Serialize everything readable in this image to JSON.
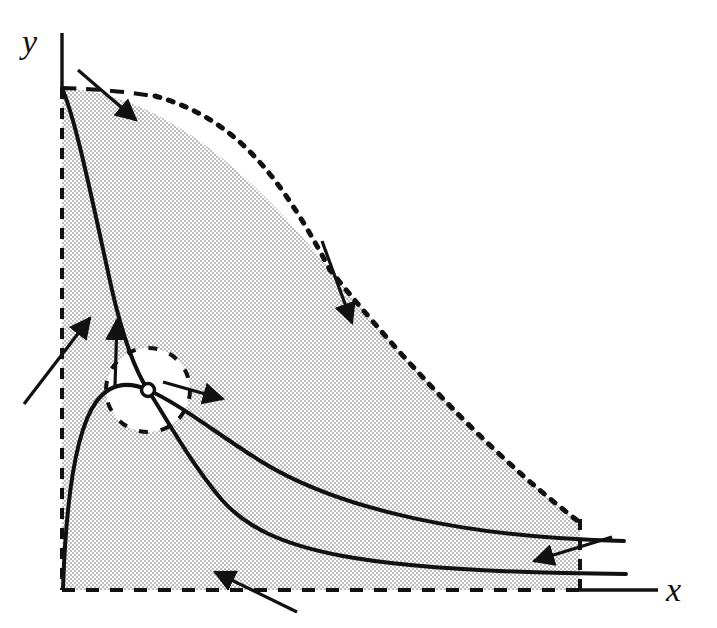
{
  "figure": {
    "kind": "phase-plane-diagram",
    "title": "",
    "background_color": "#ffffff",
    "ink_color": "#111111",
    "shade_fill_color": "#d9d9d9",
    "shade_pattern": "halftone-checker-dots",
    "axes": {
      "y_label": "y",
      "x_label": "x",
      "y_axis_line": {
        "x": 62,
        "y_top": 33,
        "y_bottom": 90
      },
      "x_axis_line": {
        "y": 590,
        "x_left": 578,
        "x_right": 658
      },
      "y_label_pos": {
        "x": 22,
        "y": 52
      },
      "x_label_pos": {
        "x": 666,
        "y": 600
      }
    },
    "region": {
      "name": "shaded-trapping-region",
      "left_boundary_style": "dashed",
      "bottom_boundary_style": "dashed",
      "right_boundary_style": "dashed",
      "diagonal_boundary_style": "dotted",
      "left_x": 62,
      "bottom_y": 590,
      "right_x": 580,
      "top_y": 88
    },
    "curves": [
      {
        "name": "steep-descending-nullcline",
        "style": "solid",
        "description": "steep curve from top-left corner descending through equilibrium to lower right"
      },
      {
        "name": "humped-nullcline",
        "style": "solid",
        "description": "curve rising from origin to a hump then decaying toward the right"
      }
    ],
    "equilibrium_marker": {
      "name": "equilibrium-point",
      "style": "open-circle",
      "cx": 148,
      "cy": 390,
      "r": 6
    },
    "highlight_circle": {
      "name": "equilibrium-neighborhood",
      "style": "dashed",
      "cx": 148,
      "cy": 390,
      "r": 42,
      "fill": "#ffffff"
    },
    "arrows": [
      {
        "name": "flow-arrow-top",
        "x1": 78,
        "y1": 70,
        "x2": 136,
        "y2": 120,
        "direction": "down-right"
      },
      {
        "name": "flow-arrow-diagonal",
        "x1": 322,
        "y1": 241,
        "x2": 352,
        "y2": 323,
        "direction": "down-right"
      },
      {
        "name": "flow-arrow-left-lower",
        "x1": 24,
        "y1": 404,
        "x2": 90,
        "y2": 318,
        "direction": "up-right"
      },
      {
        "name": "flow-arrow-vertical",
        "x1": 115,
        "y1": 386,
        "x2": 117,
        "y2": 318,
        "direction": "up"
      },
      {
        "name": "flow-arrow-equilibrium",
        "x1": 163,
        "y1": 382,
        "x2": 223,
        "y2": 399,
        "direction": "right"
      },
      {
        "name": "flow-arrow-bottom",
        "x1": 297,
        "y1": 612,
        "x2": 215,
        "y2": 572,
        "direction": "up-left"
      },
      {
        "name": "flow-arrow-right",
        "x1": 610,
        "y1": 537,
        "x2": 534,
        "y2": 560,
        "direction": "left"
      }
    ]
  }
}
